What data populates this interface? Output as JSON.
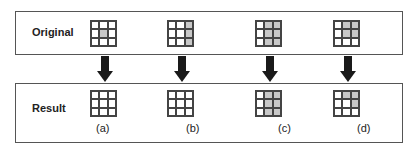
{
  "rows": {
    "original_label": "Original",
    "result_label": "Result"
  },
  "colors": {
    "filled": "#c8c8c8",
    "empty": "#ffffff",
    "border": "#444444",
    "arrow": "#1a1a1a"
  },
  "cases": [
    {
      "caption": "(a)",
      "original": [
        [
          0,
          0,
          0
        ],
        [
          0,
          1,
          0
        ],
        [
          0,
          0,
          0
        ]
      ],
      "result": [
        [
          0,
          0,
          0
        ],
        [
          0,
          0,
          0
        ],
        [
          0,
          0,
          0
        ]
      ]
    },
    {
      "caption": "(b)",
      "original": [
        [
          0,
          0,
          1
        ],
        [
          0,
          0,
          1
        ],
        [
          0,
          0,
          1
        ]
      ],
      "result": [
        [
          0,
          0,
          0
        ],
        [
          0,
          0,
          0
        ],
        [
          0,
          0,
          0
        ]
      ]
    },
    {
      "caption": "(c)",
      "original": [
        [
          0,
          1,
          1
        ],
        [
          0,
          1,
          1
        ],
        [
          0,
          1,
          1
        ]
      ],
      "result": [
        [
          0,
          1,
          1
        ],
        [
          0,
          1,
          1
        ],
        [
          0,
          1,
          1
        ]
      ]
    },
    {
      "caption": "(d)",
      "original": [
        [
          0,
          1,
          1
        ],
        [
          0,
          1,
          1
        ],
        [
          0,
          0,
          0
        ]
      ],
      "result": [
        [
          0,
          1,
          1
        ],
        [
          0,
          0,
          1
        ],
        [
          0,
          0,
          0
        ]
      ]
    }
  ]
}
